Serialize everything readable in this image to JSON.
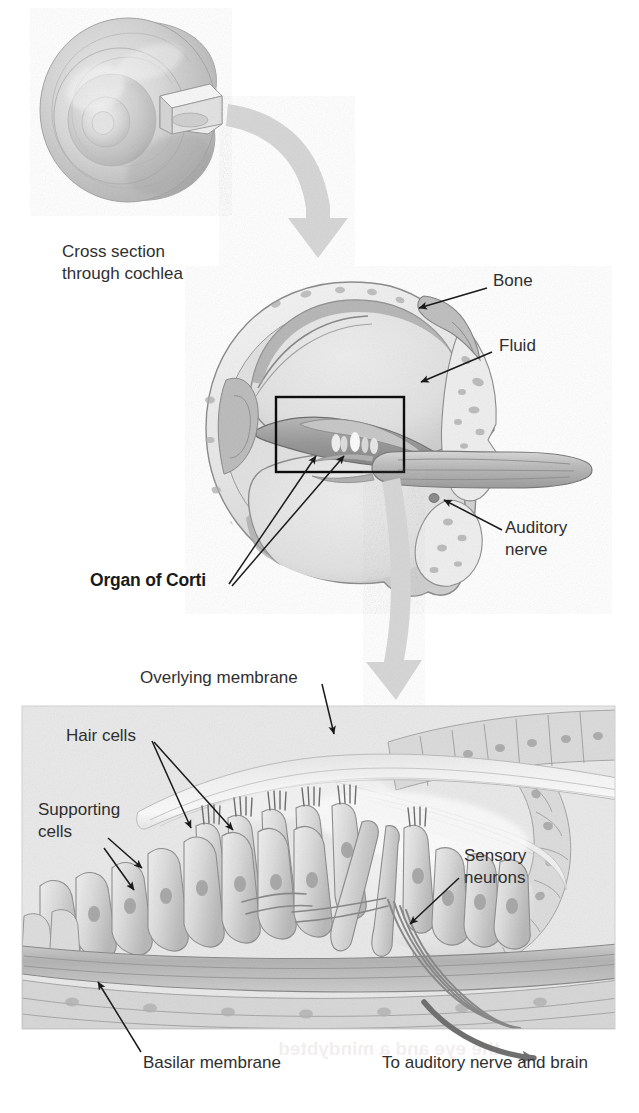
{
  "figure": {
    "background_color": "#ffffff",
    "text_color": "#2f2f2f",
    "leader_color": "#1a1a1a",
    "transition_arrow_color": "#d5d5d5",
    "nerve_arrow_color": "#6f6f6f",
    "panel_bg_color": "#e9e9e9"
  },
  "panels": {
    "top": {
      "name": "whole-cochlea-spiral",
      "caption_line1": "Cross section",
      "caption_line2": "through cochlea"
    },
    "middle": {
      "name": "cochlea-cross-section",
      "labels": {
        "bone": "Bone",
        "fluid": "Fluid",
        "auditory_nerve_line1": "Auditory",
        "auditory_nerve_line2": "nerve",
        "organ_of_corti": "Organ of Corti"
      }
    },
    "bottom": {
      "name": "organ-of-corti-detail",
      "labels": {
        "overlying_membrane": "Overlying membrane",
        "hair_cells": "Hair cells",
        "supporting_cells_line1": "Supporting",
        "supporting_cells_line2": "cells",
        "sensory_neurons_line1": "Sensory",
        "sensory_neurons_line2": "neurons",
        "basilar_membrane": "Basilar membrane",
        "to_auditory_nerve": "To auditory nerve and brain"
      }
    }
  }
}
